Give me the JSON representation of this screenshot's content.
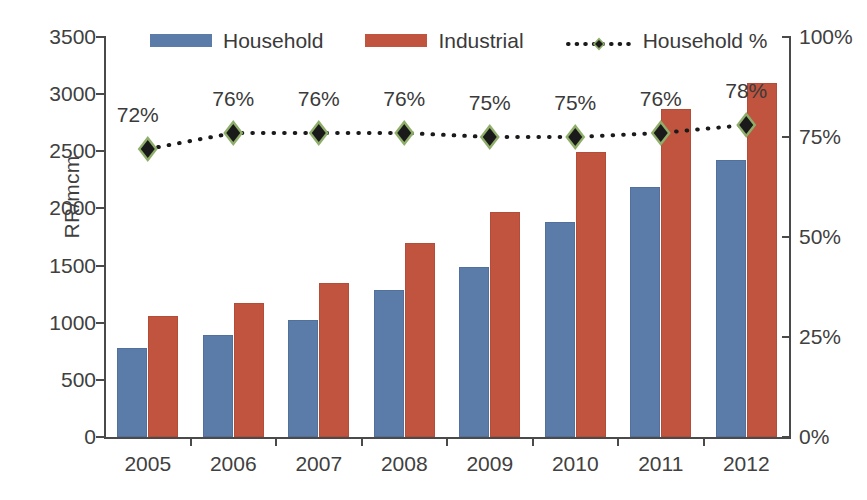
{
  "chart_data": {
    "type": "bar",
    "title": "",
    "xlabel": "",
    "ylabel": "RR/mcm",
    "y2label": "",
    "categories": [
      "2005",
      "2006",
      "2007",
      "2008",
      "2009",
      "2010",
      "2011",
      "2012"
    ],
    "ylim": [
      0,
      3500
    ],
    "y2lim": [
      0,
      100
    ],
    "yticks": [
      "0",
      "500",
      "1000",
      "1500",
      "2000",
      "2500",
      "3000",
      "3500"
    ],
    "ytick_values": [
      0,
      500,
      1000,
      1500,
      2000,
      2500,
      3000,
      3500
    ],
    "y2ticks": [
      "0%",
      "25%",
      "50%",
      "75%",
      "100%"
    ],
    "y2tick_values": [
      0,
      25,
      50,
      75,
      100
    ],
    "grid": false,
    "legend_position": "top-center",
    "series": [
      {
        "name": "Household",
        "type": "bar",
        "axis": "left",
        "color": "#5b7ba8",
        "values": [
          775,
          895,
          1025,
          1285,
          1490,
          1880,
          2190,
          2425
        ]
      },
      {
        "name": "Industrial",
        "type": "bar",
        "axis": "left",
        "color": "#c0543f",
        "values": [
          1060,
          1175,
          1350,
          1700,
          1965,
          2490,
          2870,
          3095
        ]
      },
      {
        "name": "Household %",
        "type": "line",
        "axis": "right",
        "color": "#1a1a1a",
        "marker": "diamond",
        "marker_edge_color": "#8fae6a",
        "line_style": "dotted",
        "values": [
          72,
          76,
          76,
          76,
          75,
          75,
          76,
          78
        ],
        "data_labels": [
          "72%",
          "76%",
          "76%",
          "76%",
          "75%",
          "75%",
          "76%",
          "78%"
        ]
      }
    ]
  },
  "legend": {
    "items": [
      {
        "label": "Household",
        "marker": "swatch-blue"
      },
      {
        "label": "Industrial",
        "marker": "swatch-red"
      },
      {
        "label": "Household %",
        "marker": "dotted-diamond"
      }
    ]
  }
}
